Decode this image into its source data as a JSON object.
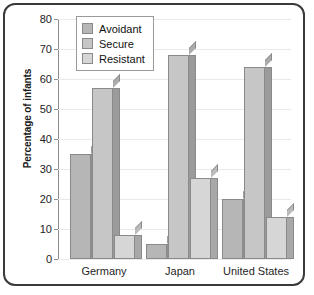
{
  "chart_data": {
    "type": "bar",
    "title": "",
    "xlabel": "",
    "ylabel": "Percentage of infants",
    "categories": [
      "Germany",
      "Japan",
      "United States"
    ],
    "series": [
      {
        "name": "Avoidant",
        "values": [
          35,
          5,
          20
        ]
      },
      {
        "name": "Secure",
        "values": [
          57,
          68,
          64
        ]
      },
      {
        "name": "Resistant",
        "values": [
          8,
          27,
          14
        ]
      }
    ],
    "ylim": [
      0,
      80
    ],
    "ytick_step": 10,
    "yticks": [
      "80",
      "70",
      "60",
      "50",
      "40",
      "30",
      "20",
      "10",
      "0"
    ],
    "grid": true,
    "legend_position": "top-left",
    "colors": {
      "avoidant": "#b6b6b6",
      "secure": "#c6c6c6",
      "resistant": "#d6d6d6",
      "bar_outline": "#8a8a8a",
      "axis": "#8d8d8d",
      "gridline": "#e9e9e9",
      "frame": "#3a3a3a",
      "background": "#ffffff"
    }
  }
}
